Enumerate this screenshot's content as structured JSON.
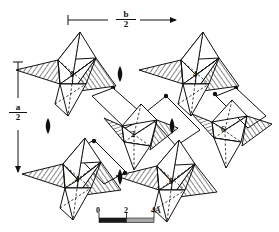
{
  "figure": {
    "background_color": "#ffffff",
    "line_color": "#111111",
    "hatch_color": "#111111",
    "width": 279,
    "height": 232
  },
  "axes": {
    "horizontal": {
      "name": "b-axis-indicator",
      "numerator": "b",
      "denominator": "2",
      "direction": "right",
      "x_start": 68,
      "x_end": 182,
      "y": 20
    },
    "vertical": {
      "name": "a-axis-indicator",
      "numerator": "a",
      "denominator": "2",
      "direction": "down",
      "y_start": 62,
      "y_end": 178,
      "x": 18
    }
  },
  "scale_bar": {
    "name": "scale-bar",
    "ticks": [
      "0",
      "2",
      "4Å"
    ],
    "unit": "Å",
    "x": 99,
    "y": 218,
    "length": 55,
    "segments": [
      {
        "fill": "#1a1a1a",
        "from": 0,
        "to": 0.5
      },
      {
        "fill": "#a8a8a8",
        "from": 0.5,
        "to": 1.0
      }
    ]
  },
  "clusters": [
    {
      "id": "cluster-top-left",
      "height_label": "0",
      "cx": 73,
      "cy": 73,
      "lx": 70,
      "ly": 70
    },
    {
      "id": "cluster-top-right",
      "height_label": "4",
      "cx": 196,
      "cy": 73,
      "lx": 193,
      "ly": 70
    },
    {
      "id": "cluster-center",
      "height_label": "2",
      "cx": 134,
      "cy": 133,
      "lx": 131,
      "ly": 130
    },
    {
      "id": "cluster-middle-right",
      "height_label": "6",
      "cx": 224,
      "cy": 128,
      "lx": 221,
      "ly": 125
    },
    {
      "id": "cluster-bottom-left",
      "height_label": "4",
      "cx": 78,
      "cy": 178,
      "lx": 75,
      "ly": 175
    },
    {
      "id": "cluster-bottom-right",
      "height_label": "0",
      "cx": 172,
      "cy": 180,
      "lx": 169,
      "ly": 177
    }
  ],
  "twofold_axes": [
    {
      "id": "twofold-top-center",
      "x": 120,
      "y": 74
    },
    {
      "id": "twofold-left-middle",
      "x": 48,
      "y": 126
    },
    {
      "id": "twofold-right-middle",
      "x": 172,
      "y": 126
    },
    {
      "id": "twofold-bottom-center",
      "x": 120,
      "y": 177
    }
  ],
  "legend": {
    "atom_marker": "filled-circle",
    "bond_style_solid": "solid-edge-front",
    "bond_style_dashed": "dashed-edge-rear",
    "face_style": "hatched-face"
  }
}
